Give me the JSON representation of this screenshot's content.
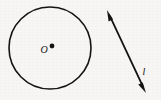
{
  "figure": {
    "background_color": "#f7f6f4",
    "ink_color": "#141414",
    "width": 161,
    "height": 100,
    "circle": {
      "label": "O",
      "center_x": 50,
      "center_y": 48,
      "radius": 41,
      "stroke_width": 1.6,
      "center_dot_x": 52,
      "center_dot_y": 46,
      "center_dot_radius": 2.4,
      "label_x": 44,
      "label_y": 53
    },
    "line": {
      "label": "l",
      "x1": 107,
      "y1": 10,
      "x2": 146,
      "y2": 93,
      "stroke_width": 1.8,
      "arrowheads": "both",
      "label_x": 144,
      "label_y": 75
    }
  }
}
